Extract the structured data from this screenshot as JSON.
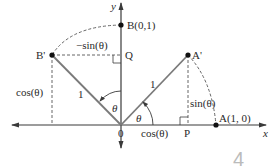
{
  "diagram": {
    "title": "",
    "axes": {
      "x_label": "x",
      "y_label": "y",
      "origin_label": "0"
    },
    "points": {
      "B": "B(0,1)",
      "Q": "Q",
      "B_prime": "B'",
      "A_prime": "A'",
      "P": "P",
      "A": "A(1, 0)"
    },
    "segment_labels": {
      "neg_sin": "−sin(θ)",
      "cos_left": "cos(θ)",
      "one_left": "1",
      "one_right": "1",
      "sin_right": "sin(θ)",
      "cos_bottom": "cos(θ)"
    },
    "angle_labels": {
      "theta_left": "θ",
      "theta_right": "θ"
    },
    "artifact": "4"
  },
  "colors": {
    "axis": "#3a3a3a",
    "radius": "#7a7a7a",
    "dashed": "#555555",
    "point": "#111111",
    "text": "#2a2a2a"
  }
}
